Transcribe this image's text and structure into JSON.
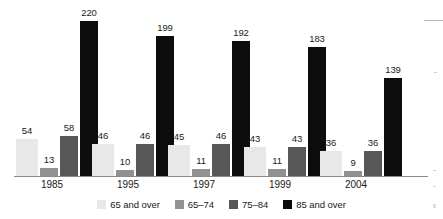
{
  "chart_data": {
    "type": "bar",
    "title": "",
    "subtitle": "",
    "xlabel": "",
    "ylabel": "",
    "grid": false,
    "legend_position": "bottom",
    "ylim": [
      0,
      220
    ],
    "categories": [
      "1985",
      "1995",
      "1997",
      "1999",
      "2004"
    ],
    "series": [
      {
        "name": "65 and over",
        "color": "#e8e8e8",
        "values": [
          54,
          46,
          45,
          43,
          36
        ]
      },
      {
        "name": "65–74",
        "color": "#919191",
        "values": [
          13,
          10,
          11,
          11,
          9
        ]
      },
      {
        "name": "75–84",
        "color": "#575757",
        "values": [
          58,
          46,
          46,
          43,
          36
        ]
      },
      {
        "name": "85 and over",
        "color": "#0d0d0d",
        "values": [
          220,
          199,
          192,
          183,
          139
        ]
      }
    ],
    "data_labels": [
      [
        "54",
        "13",
        "58",
        "220"
      ],
      [
        "46",
        "10",
        "46",
        "199"
      ],
      [
        "45",
        "11",
        "46",
        "192"
      ],
      [
        "43",
        "11",
        "43",
        "183"
      ],
      [
        "36",
        "9",
        "36",
        "139"
      ]
    ]
  },
  "legend": {
    "items": [
      {
        "label": "65 and over",
        "color": "#e8e8e8"
      },
      {
        "label": "65–74",
        "color": "#919191"
      },
      {
        "label": "75–84",
        "color": "#575757"
      },
      {
        "label": "85 and over",
        "color": "#0d0d0d"
      }
    ]
  },
  "axis": {
    "category_labels": [
      "1985",
      "1995",
      "1997",
      "1999",
      "2004"
    ],
    "baseline_color": "#8a8a8a"
  }
}
